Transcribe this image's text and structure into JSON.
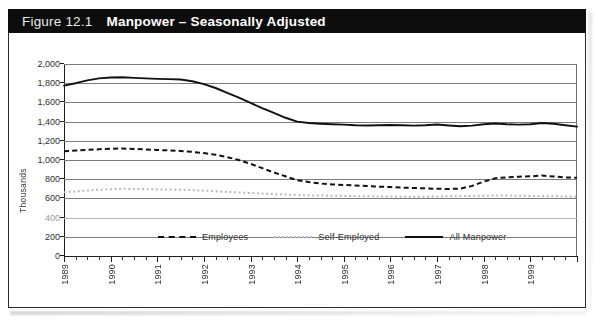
{
  "figure": {
    "number_label": "Figure 12.1",
    "title": "Manpower – Seasonally Adjusted"
  },
  "chart_data": {
    "type": "line",
    "title": "Manpower – Seasonally Adjusted",
    "xlabel": "",
    "ylabel": "Thousands",
    "ylim": [
      0,
      2000
    ],
    "ytick_labels": [
      "2,000",
      "1,800",
      "1,600",
      "1,400",
      "1,200",
      "1,000",
      "800",
      "600",
      "400",
      "200",
      "0"
    ],
    "ytick_values": [
      2000,
      1800,
      1600,
      1400,
      1200,
      1000,
      800,
      600,
      400,
      200,
      0
    ],
    "grid": true,
    "legend_position": "bottom-center",
    "xlim": [
      1989,
      2000
    ],
    "xtick_labels": [
      "1989",
      "1990",
      "1991",
      "1992",
      "1993",
      "1994",
      "1995",
      "1996",
      "1997",
      "1998",
      "1999"
    ],
    "x_minor_ticks_per_year": 4,
    "x": [
      1989.0,
      1989.25,
      1989.5,
      1989.75,
      1990.0,
      1990.25,
      1990.5,
      1990.75,
      1991.0,
      1991.25,
      1991.5,
      1991.75,
      1992.0,
      1992.25,
      1992.5,
      1992.75,
      1993.0,
      1993.25,
      1993.5,
      1993.75,
      1994.0,
      1994.25,
      1994.5,
      1994.75,
      1995.0,
      1995.25,
      1995.5,
      1995.75,
      1996.0,
      1996.25,
      1996.5,
      1996.75,
      1997.0,
      1997.25,
      1997.5,
      1997.75,
      1998.0,
      1998.25,
      1998.5,
      1998.75,
      1999.0,
      1999.25,
      1999.5,
      1999.75,
      2000.0
    ],
    "series": [
      {
        "name": "All Manpower",
        "style": "solid",
        "color": "#111111",
        "values": [
          1775,
          1800,
          1830,
          1850,
          1860,
          1862,
          1855,
          1850,
          1845,
          1842,
          1838,
          1820,
          1790,
          1750,
          1700,
          1650,
          1595,
          1540,
          1490,
          1440,
          1400,
          1385,
          1378,
          1372,
          1368,
          1362,
          1360,
          1362,
          1365,
          1362,
          1358,
          1362,
          1370,
          1360,
          1352,
          1358,
          1372,
          1380,
          1372,
          1368,
          1372,
          1385,
          1378,
          1362,
          1348
        ]
      },
      {
        "name": "Employees",
        "style": "dashed",
        "color": "#111111",
        "values": [
          1090,
          1098,
          1105,
          1112,
          1118,
          1120,
          1115,
          1110,
          1105,
          1100,
          1095,
          1085,
          1072,
          1055,
          1030,
          1000,
          960,
          915,
          870,
          830,
          790,
          770,
          755,
          745,
          740,
          735,
          728,
          722,
          718,
          712,
          708,
          705,
          700,
          698,
          702,
          730,
          775,
          810,
          820,
          826,
          830,
          838,
          828,
          818,
          815
        ]
      },
      {
        "name": "Self-Employed",
        "style": "dotted",
        "color": "#b9b9b9",
        "values": [
          665,
          672,
          682,
          690,
          696,
          700,
          698,
          696,
          694,
          692,
          690,
          686,
          680,
          674,
          668,
          662,
          656,
          650,
          645,
          640,
          636,
          632,
          630,
          628,
          626,
          624,
          622,
          620,
          620,
          618,
          618,
          618,
          620,
          622,
          624,
          626,
          628,
          630,
          630,
          628,
          626,
          624,
          622,
          620,
          618
        ]
      }
    ]
  },
  "legend": {
    "items": [
      {
        "label": "Employees",
        "style": "dashed"
      },
      {
        "label": "Self-Employed",
        "style": "dotted"
      },
      {
        "label": "All Manpower",
        "style": "solid"
      }
    ]
  }
}
